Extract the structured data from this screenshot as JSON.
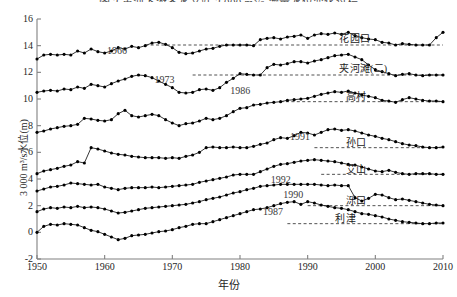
{
  "figure": {
    "cut_off_caption": "图 3  黄河下游各水文站 3 000 m³/s 流量水位变化过程",
    "xlabel": "年份",
    "ylabel": "3 000 m³/s水位(m)"
  },
  "axes": {
    "x_ticks": [
      "1950",
      "1960",
      "1970",
      "1980",
      "1990",
      "2000",
      "2010"
    ],
    "y_ticks": [
      "-2",
      "0",
      "2",
      "4",
      "6",
      "8",
      "10",
      "12",
      "14",
      "16"
    ]
  },
  "colors": {
    "line": "#111111",
    "marker": "#000000",
    "axis": "#808080",
    "reference": "#333333",
    "background": "#ffffff"
  },
  "chart_data": {
    "type": "line",
    "title": "图 3  黄河下游各水文站 3 000 m³/s 流量水位变化过程",
    "xlabel": "年份",
    "ylabel": "3 000 m³/s水位(m)",
    "xlim": [
      1950,
      2010
    ],
    "ylim": [
      -2,
      16
    ],
    "grid": false,
    "legend": "inline-labels",
    "x": [
      1950,
      1951,
      1952,
      1953,
      1954,
      1955,
      1956,
      1957,
      1958,
      1959,
      1960,
      1961,
      1962,
      1963,
      1964,
      1965,
      1966,
      1967,
      1968,
      1969,
      1970,
      1971,
      1972,
      1973,
      1974,
      1975,
      1976,
      1977,
      1978,
      1979,
      1980,
      1981,
      1982,
      1983,
      1984,
      1985,
      1986,
      1987,
      1988,
      1989,
      1990,
      1991,
      1992,
      1993,
      1994,
      1995,
      1996,
      1997,
      1998,
      1999,
      2000,
      2001,
      2002,
      2003,
      2004,
      2005,
      2006,
      2007,
      2008,
      2009,
      2010
    ],
    "series": [
      {
        "name": "花园口",
        "label": "花园口",
        "reference_year": 1966,
        "reference_level": 14.05,
        "values": [
          13.0,
          13.3,
          13.35,
          13.3,
          13.35,
          13.3,
          13.6,
          13.45,
          13.75,
          13.55,
          13.45,
          13.6,
          13.85,
          13.75,
          13.95,
          13.85,
          14.0,
          14.2,
          14.25,
          14.1,
          13.85,
          13.5,
          13.4,
          13.45,
          13.6,
          13.75,
          13.8,
          13.95,
          14.05,
          14.05,
          14.05,
          14.05,
          14.0,
          14.45,
          14.55,
          14.6,
          14.5,
          14.65,
          14.7,
          14.8,
          14.55,
          14.8,
          14.9,
          14.85,
          14.95,
          14.85,
          15.0,
          14.75,
          14.6,
          14.5,
          14.45,
          14.25,
          14.2,
          14.05,
          14.15,
          14.1,
          14.05,
          14.05,
          14.05,
          14.6,
          15.0
        ]
      },
      {
        "name": "夹河滩(二)",
        "label": "夹河滩(二)",
        "reference_year": 1973,
        "reference_level": 11.8,
        "values": [
          10.5,
          10.6,
          10.65,
          10.6,
          10.75,
          10.7,
          10.9,
          10.8,
          11.1,
          11.0,
          10.9,
          11.15,
          11.35,
          11.5,
          11.7,
          11.8,
          11.75,
          11.6,
          11.35,
          11.1,
          10.85,
          10.5,
          10.45,
          10.5,
          10.7,
          10.75,
          10.65,
          10.85,
          11.25,
          11.55,
          11.9,
          11.85,
          11.8,
          11.8,
          12.35,
          12.6,
          12.55,
          12.65,
          12.8,
          12.8,
          12.7,
          12.85,
          12.95,
          13.1,
          13.25,
          13.3,
          13.35,
          13.15,
          12.95,
          12.55,
          12.2,
          12.05,
          11.9,
          11.75,
          11.85,
          11.9,
          11.8,
          11.75,
          11.8,
          11.8,
          11.8
        ]
      },
      {
        "name": "高村",
        "label": "高村",
        "reference_year": 1986,
        "reference_level": 9.8,
        "values": [
          7.5,
          7.6,
          7.75,
          7.85,
          7.95,
          8.0,
          8.1,
          8.55,
          8.5,
          8.4,
          8.35,
          8.45,
          8.9,
          9.15,
          8.75,
          8.65,
          8.75,
          8.85,
          8.75,
          8.45,
          8.2,
          8.0,
          8.15,
          8.2,
          8.35,
          8.55,
          8.45,
          8.55,
          8.75,
          9.05,
          9.3,
          9.35,
          9.55,
          9.6,
          9.7,
          9.75,
          9.8,
          9.9,
          9.95,
          10.0,
          10.05,
          10.2,
          10.35,
          10.45,
          10.55,
          10.5,
          10.6,
          10.45,
          10.3,
          10.2,
          10.1,
          9.9,
          9.85,
          9.75,
          9.95,
          10.1,
          10.0,
          9.9,
          9.85,
          9.85,
          9.8
        ]
      },
      {
        "name": "孙口",
        "label": "孙口",
        "reference_year": 1991,
        "reference_level": 6.35,
        "values": [
          4.4,
          4.6,
          4.7,
          4.8,
          4.95,
          5.05,
          5.3,
          5.2,
          6.35,
          6.25,
          6.1,
          5.95,
          5.85,
          5.8,
          5.7,
          5.65,
          5.6,
          5.6,
          5.6,
          5.55,
          5.6,
          5.55,
          5.7,
          5.8,
          6.0,
          6.35,
          6.4,
          6.35,
          6.35,
          6.4,
          6.35,
          6.35,
          6.45,
          6.6,
          6.7,
          6.95,
          7.1,
          7.05,
          7.25,
          7.5,
          7.45,
          7.3,
          7.5,
          7.7,
          7.75,
          7.65,
          7.7,
          7.6,
          7.45,
          7.3,
          7.2,
          7.05,
          6.95,
          6.8,
          6.65,
          6.55,
          6.5,
          6.4,
          6.35,
          6.35,
          6.4
        ]
      },
      {
        "name": "艾山",
        "label": "艾山",
        "reference_year": 1992,
        "reference_level": 4.35,
        "values": [
          3.1,
          3.25,
          3.4,
          3.45,
          3.55,
          3.7,
          3.65,
          3.6,
          3.55,
          3.6,
          3.4,
          3.3,
          3.2,
          3.3,
          3.35,
          3.35,
          3.35,
          3.4,
          3.35,
          3.4,
          3.45,
          3.5,
          3.55,
          3.6,
          3.75,
          3.85,
          3.95,
          4.05,
          4.15,
          4.3,
          4.35,
          4.35,
          4.35,
          4.55,
          4.75,
          4.95,
          5.1,
          5.15,
          5.25,
          5.35,
          5.4,
          5.45,
          5.4,
          5.35,
          5.3,
          5.2,
          5.1,
          5.05,
          4.9,
          4.75,
          4.6,
          4.55,
          4.65,
          4.5,
          4.4,
          4.35,
          4.4,
          4.4,
          4.4,
          4.35,
          4.35
        ]
      },
      {
        "name": "泺口",
        "label": "泺口",
        "reference_year": 1990,
        "reference_level": 2.0,
        "values": [
          1.55,
          1.75,
          1.85,
          1.8,
          1.9,
          1.85,
          1.95,
          1.85,
          1.9,
          1.85,
          1.75,
          1.6,
          1.45,
          1.5,
          1.6,
          1.7,
          1.8,
          1.85,
          1.9,
          1.95,
          2.0,
          2.05,
          2.1,
          2.2,
          2.3,
          2.45,
          2.55,
          2.65,
          2.8,
          2.95,
          3.05,
          3.2,
          3.3,
          3.45,
          3.5,
          3.55,
          3.6,
          3.6,
          3.6,
          3.6,
          3.6,
          3.6,
          3.55,
          3.5,
          3.55,
          3.5,
          3.5,
          2.6,
          2.35,
          2.55,
          2.85,
          2.8,
          2.6,
          2.45,
          2.5,
          2.4,
          2.3,
          2.2,
          2.1,
          2.05,
          2.0
        ]
      },
      {
        "name": "利津",
        "label": "利津",
        "reference_year": 1987,
        "reference_level": 0.65,
        "values": [
          0.0,
          0.45,
          0.6,
          0.55,
          0.65,
          0.6,
          0.55,
          0.35,
          0.15,
          0.05,
          -0.15,
          -0.35,
          -0.55,
          -0.45,
          -0.25,
          -0.2,
          -0.15,
          -0.05,
          0.05,
          0.1,
          0.2,
          0.35,
          0.45,
          0.6,
          0.65,
          0.65,
          0.8,
          0.95,
          1.1,
          1.25,
          1.4,
          1.55,
          1.7,
          1.75,
          1.85,
          2.0,
          2.15,
          2.25,
          2.3,
          2.1,
          2.3,
          2.2,
          2.05,
          1.95,
          1.85,
          1.8,
          1.7,
          1.55,
          1.4,
          1.35,
          1.25,
          1.15,
          1.0,
          0.9,
          0.8,
          0.75,
          0.7,
          0.65,
          0.65,
          0.7,
          0.7
        ]
      }
    ],
    "annotations": [
      {
        "text": "1966",
        "series": "花园口",
        "year": 1966
      },
      {
        "text": "1973",
        "series": "夹河滩(二)",
        "year": 1973
      },
      {
        "text": "1986",
        "series": "高村",
        "year": 1986
      },
      {
        "text": "1991",
        "series": "孙口",
        "year": 1991
      },
      {
        "text": "1992",
        "series": "艾山",
        "year": 1992
      },
      {
        "text": "1990",
        "series": "泺口",
        "year": 1990
      },
      {
        "text": "1987",
        "series": "利津",
        "year": 1987
      }
    ]
  }
}
